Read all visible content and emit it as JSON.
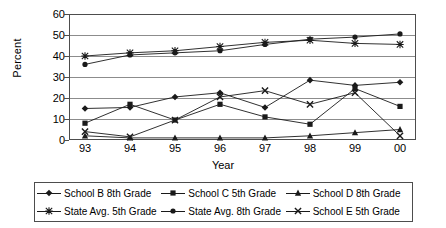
{
  "chart_data": {
    "type": "line",
    "title": "",
    "xlabel": "Year",
    "ylabel": "Percent",
    "categories": [
      "93",
      "94",
      "95",
      "96",
      "97",
      "98",
      "99",
      "00"
    ],
    "x": [
      93,
      94,
      95,
      96,
      97,
      98,
      99,
      0
    ],
    "ylim": [
      0,
      60
    ],
    "yticks": [
      0,
      10,
      20,
      30,
      40,
      50,
      60
    ],
    "grid": true,
    "legend_position": "bottom",
    "series": [
      {
        "name": "School B 8th Grade",
        "marker": "diamond",
        "values": [
          15,
          15.5,
          20.5,
          22.5,
          15.5,
          28.5,
          26,
          27.5
        ]
      },
      {
        "name": "School C 5th Grade",
        "marker": "square",
        "values": [
          8,
          17,
          9.5,
          17,
          11,
          7.5,
          24.5,
          16
        ]
      },
      {
        "name": "School D 8th Grade",
        "marker": "triangle",
        "values": [
          2,
          1,
          1,
          1,
          1,
          2,
          3.5,
          5
        ]
      },
      {
        "name": "State Avg. 5th Grade",
        "marker": "asterisk",
        "values": [
          40,
          41.5,
          42.5,
          44.5,
          46.5,
          47.5,
          46,
          45.5
        ]
      },
      {
        "name": "State Avg. 8th Grade",
        "marker": "circle",
        "values": [
          36,
          40.5,
          41.5,
          42.5,
          45.5,
          48,
          49,
          50.5
        ]
      },
      {
        "name": "School E 5th Grade",
        "marker": "cross",
        "values": [
          4,
          1.5,
          9.5,
          20.5,
          23.5,
          17,
          22.5,
          2
        ]
      }
    ],
    "colors": {
      "line": "#1a1a1a",
      "grid": "#8c8c8c",
      "axis": "#4d4d4d",
      "background": "#ffffff"
    }
  },
  "legend": {
    "items": [
      {
        "label": "School B 8th Grade",
        "marker": "diamond",
        "icon": "diamond-marker-icon"
      },
      {
        "label": "School C 5th Grade",
        "marker": "square",
        "icon": "square-marker-icon"
      },
      {
        "label": "School D 8th Grade",
        "marker": "triangle",
        "icon": "triangle-marker-icon"
      },
      {
        "label": "State Avg. 5th Grade",
        "marker": "asterisk",
        "icon": "asterisk-marker-icon"
      },
      {
        "label": "State Avg. 8th Grade",
        "marker": "circle",
        "icon": "circle-marker-icon"
      },
      {
        "label": "School E 5th Grade",
        "marker": "cross",
        "icon": "cross-marker-icon"
      }
    ]
  }
}
